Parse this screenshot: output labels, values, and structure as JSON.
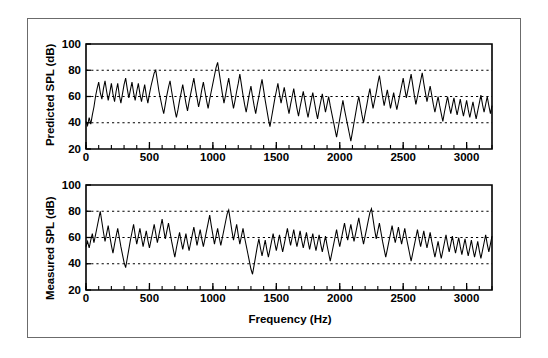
{
  "figure": {
    "border_color": "#6b6b6b",
    "background": "#ffffff",
    "line_color": "#000000"
  },
  "axis_labels": {
    "y_top": "Predicted SPL (dB)",
    "y_bottom": "Measured SPL (dB)",
    "x": "Frequency (Hz)"
  },
  "ticks": {
    "y_labels": [
      "100",
      "80",
      "60",
      "40",
      "20"
    ],
    "y_values": [
      100,
      80,
      60,
      40,
      20
    ],
    "x_labels": [
      "0",
      "500",
      "1000",
      "1500",
      "2000",
      "2500",
      "3000"
    ],
    "x_values": [
      0,
      500,
      1000,
      1500,
      2000,
      2500,
      3000
    ],
    "x_minor_step": 100,
    "gridlines_y": [
      80,
      60,
      40
    ]
  },
  "chart_data": [
    {
      "type": "line",
      "title": "",
      "panel": "top",
      "xlabel": "Frequency (Hz)",
      "ylabel": "Predicted SPL (dB)",
      "xlim": [
        0,
        3200
      ],
      "ylim": [
        20,
        100
      ],
      "grid": true,
      "grid_style": "dotted-horizontal",
      "legend": "none",
      "series_name": "Predicted SPL",
      "x_step": 12.5,
      "values": [
        41,
        38,
        44,
        39,
        46,
        52,
        60,
        66,
        71,
        63,
        58,
        66,
        72,
        64,
        57,
        63,
        70,
        62,
        56,
        64,
        70,
        61,
        55,
        62,
        69,
        74,
        66,
        59,
        65,
        71,
        63,
        57,
        64,
        70,
        62,
        56,
        63,
        69,
        61,
        55,
        62,
        68,
        73,
        78,
        80,
        72,
        64,
        58,
        52,
        47,
        54,
        61,
        67,
        72,
        64,
        57,
        50,
        44,
        50,
        57,
        63,
        69,
        62,
        55,
        49,
        56,
        62,
        68,
        74,
        66,
        59,
        52,
        58,
        65,
        71,
        64,
        57,
        51,
        58,
        64,
        70,
        76,
        82,
        86,
        78,
        70,
        62,
        55,
        61,
        68,
        74,
        66,
        58,
        51,
        57,
        64,
        70,
        77,
        69,
        61,
        54,
        48,
        55,
        62,
        68,
        60,
        53,
        47,
        54,
        60,
        67,
        73,
        65,
        57,
        50,
        43,
        37,
        44,
        51,
        58,
        64,
        70,
        62,
        55,
        61,
        67,
        60,
        53,
        47,
        54,
        60,
        66,
        58,
        51,
        45,
        52,
        58,
        64,
        57,
        50,
        44,
        51,
        57,
        63,
        56,
        49,
        43,
        50,
        56,
        62,
        55,
        48,
        54,
        60,
        53,
        47,
        41,
        35,
        29,
        36,
        43,
        50,
        57,
        50,
        44,
        38,
        32,
        26,
        33,
        40,
        47,
        54,
        60,
        53,
        46,
        40,
        47,
        53,
        60,
        66,
        58,
        51,
        57,
        63,
        70,
        76,
        68,
        60,
        53,
        59,
        65,
        58,
        51,
        57,
        63,
        56,
        50,
        56,
        62,
        68,
        74,
        66,
        59,
        65,
        71,
        77,
        69,
        61,
        54,
        60,
        66,
        72,
        78,
        70,
        63,
        56,
        62,
        68,
        61,
        54,
        48,
        54,
        60,
        53,
        47,
        41,
        48,
        54,
        60,
        53,
        47,
        53,
        59,
        52,
        46,
        52,
        58,
        51,
        45,
        51,
        57,
        50,
        44,
        50,
        56,
        49,
        43,
        49,
        55,
        61,
        54,
        48,
        54,
        60,
        53,
        47,
        53,
        59,
        52,
        46,
        52,
        58,
        51,
        45,
        51,
        57,
        50,
        44,
        50,
        56,
        62,
        55,
        49,
        55,
        61,
        54,
        48,
        54,
        60,
        53,
        47,
        41,
        47,
        53,
        46,
        40,
        46,
        52,
        45,
        39,
        45,
        51,
        44,
        38,
        44,
        50,
        43,
        37,
        43,
        49,
        42,
        36,
        42,
        48,
        41,
        35,
        41,
        47,
        40,
        34,
        40,
        46,
        39,
        45,
        38,
        44,
        50,
        43,
        37,
        43,
        49,
        42,
        36,
        42,
        48
      ]
    },
    {
      "type": "line",
      "title": "",
      "panel": "bottom",
      "xlabel": "Frequency (Hz)",
      "ylabel": "Measured SPL (dB)",
      "xlim": [
        0,
        3200
      ],
      "ylim": [
        20,
        100
      ],
      "grid": true,
      "grid_style": "dotted-horizontal",
      "legend": "none",
      "series_name": "Measured SPL",
      "x_step": 12.5,
      "values": [
        53,
        57,
        52,
        58,
        63,
        56,
        62,
        68,
        74,
        80,
        72,
        64,
        57,
        63,
        69,
        61,
        54,
        48,
        55,
        61,
        67,
        60,
        53,
        47,
        41,
        37,
        44,
        51,
        58,
        64,
        70,
        62,
        55,
        61,
        67,
        60,
        53,
        59,
        65,
        58,
        52,
        58,
        64,
        70,
        63,
        56,
        62,
        68,
        74,
        66,
        59,
        65,
        71,
        64,
        57,
        51,
        45,
        52,
        58,
        64,
        57,
        51,
        57,
        63,
        56,
        50,
        56,
        62,
        68,
        61,
        54,
        60,
        66,
        59,
        53,
        59,
        65,
        71,
        77,
        69,
        62,
        55,
        61,
        67,
        60,
        54,
        60,
        66,
        72,
        78,
        81,
        73,
        65,
        58,
        64,
        70,
        62,
        55,
        61,
        67,
        60,
        54,
        48,
        42,
        36,
        32,
        39,
        46,
        53,
        59,
        52,
        46,
        52,
        58,
        51,
        45,
        51,
        57,
        63,
        56,
        50,
        56,
        62,
        55,
        49,
        55,
        61,
        67,
        60,
        54,
        60,
        66,
        59,
        53,
        59,
        65,
        58,
        52,
        58,
        64,
        57,
        51,
        57,
        63,
        56,
        50,
        56,
        62,
        55,
        49,
        55,
        61,
        54,
        48,
        42,
        48,
        54,
        60,
        66,
        59,
        53,
        59,
        65,
        71,
        64,
        58,
        64,
        70,
        63,
        57,
        63,
        69,
        75,
        68,
        61,
        55,
        61,
        67,
        73,
        79,
        82,
        74,
        66,
        59,
        65,
        71,
        64,
        57,
        51,
        45,
        51,
        57,
        63,
        69,
        62,
        56,
        62,
        68,
        61,
        55,
        61,
        67,
        60,
        54,
        48,
        42,
        48,
        54,
        60,
        66,
        59,
        53,
        59,
        65,
        58,
        52,
        58,
        64,
        57,
        51,
        45,
        51,
        57,
        50,
        44,
        50,
        56,
        62,
        55,
        49,
        55,
        61,
        54,
        48,
        54,
        60,
        53,
        47,
        53,
        59,
        52,
        46,
        52,
        58,
        51,
        45,
        51,
        57,
        50,
        44,
        50,
        56,
        62,
        55,
        49,
        55,
        61,
        54,
        48,
        54,
        60,
        53,
        47,
        41,
        47,
        53,
        59,
        52,
        46,
        52,
        58,
        64,
        57,
        51,
        57,
        63,
        56,
        50,
        56,
        62,
        55,
        49,
        43,
        49,
        55,
        61,
        54,
        48,
        54,
        60,
        53,
        47,
        41,
        47,
        53,
        46,
        40,
        46,
        52,
        45,
        39,
        45,
        51,
        44,
        38,
        44,
        50,
        43,
        37,
        43,
        49,
        42,
        36,
        42,
        48,
        41,
        35,
        41,
        47,
        40,
        46,
        52,
        45,
        39,
        45
      ]
    }
  ]
}
